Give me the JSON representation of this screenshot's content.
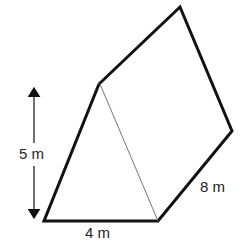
{
  "diagram": {
    "type": "triangular-prism",
    "labels": {
      "height": "5 m",
      "base": "4 m",
      "length": "8 m"
    },
    "colors": {
      "stroke": "#111111",
      "hidden_edge": "#777777",
      "background": "#ffffff"
    }
  }
}
